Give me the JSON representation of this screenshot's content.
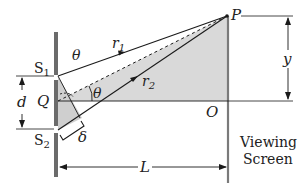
{
  "labels": {
    "s1": "S",
    "s1_sub": "1",
    "s2": "S",
    "s2_sub": "2",
    "q": "Q",
    "p": "P",
    "o": "O",
    "r1": "r",
    "r1_sub": "1",
    "r2": "r",
    "r2_sub": "2",
    "theta_top": "θ",
    "theta_mid": "θ",
    "delta": "δ",
    "d": "d",
    "y": "y",
    "L": "L",
    "screen_line1": "Viewing",
    "screen_line2": "Screen"
  },
  "colors": {
    "line": "#1a1a1a",
    "barrier": "#6b6b6b",
    "shade": "#d9d9d9",
    "screen": "#7a7a7a"
  }
}
